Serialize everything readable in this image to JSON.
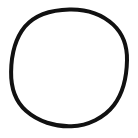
{
  "canvas": {
    "width": 138,
    "height": 138,
    "background_color": "#ffffff",
    "description": "Hand-drawn black circle outline on a plain white background"
  },
  "drawing": {
    "name": "hand-drawn-circle",
    "shape": "circle",
    "stroke_color": "#111111",
    "fill_color": "none",
    "stroke_width": 4,
    "stroke_linecap": "round",
    "stroke_linejoin": "round",
    "closed": true,
    "center_x": 69,
    "center_y": 67.5,
    "radius_x": 58,
    "radius_y": 58.5,
    "bounds": {
      "left": 11,
      "top": 9,
      "right": 127,
      "bottom": 126
    },
    "path": "M 69.5 9.4 C 86.5 9.0 102.2 14.4 113.2 24.6 C 123.0 33.8 127.3 46.6 127.0 60.3 C 126.7 76.5 123.6 92.3 114.0 105.0 C 104.3 117.8 88.0 125.6 71.5 126.2 C 55.0 126.8 38.0 121.5 26.0 110.8 C 15.2 101.2 10.9 86.8 11.1 72.0 C 11.3 55.8 14.8 39.0 25.0 26.6 C 35.4 14.0 52.6 9.8 69.5 9.4 Z"
  }
}
